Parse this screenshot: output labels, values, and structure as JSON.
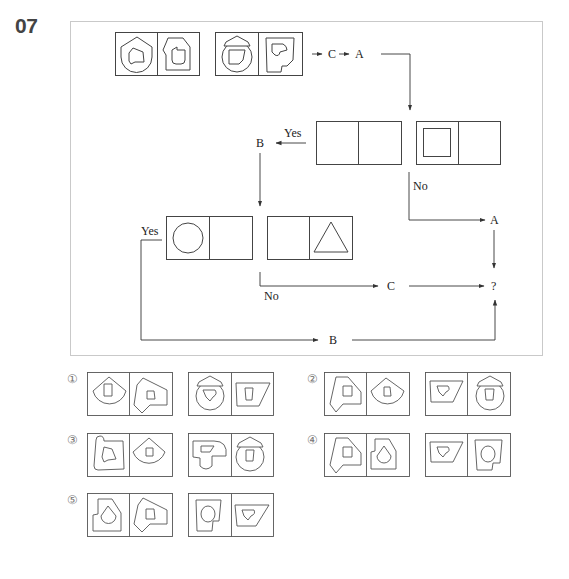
{
  "question": {
    "number": "07"
  },
  "flowchart": {
    "start_panels": [
      "panel-pair-1",
      "panel-pair-2"
    ],
    "top_ops": [
      "C",
      "A"
    ],
    "decision_1": {
      "yes_label": "Yes",
      "yes_op": "B",
      "no_label": "No",
      "no_op": "A"
    },
    "decision_2": {
      "yes_label": "Yes",
      "yes_op": "B",
      "no_label": "No",
      "no_op": "C"
    },
    "result": "?"
  },
  "options": [
    {
      "label": "①"
    },
    {
      "label": "②"
    },
    {
      "label": "③"
    },
    {
      "label": "④"
    },
    {
      "label": "⑤"
    }
  ],
  "colors": {
    "line": "#333333",
    "frame": "#c9c9c9",
    "qnum": "#444444"
  }
}
